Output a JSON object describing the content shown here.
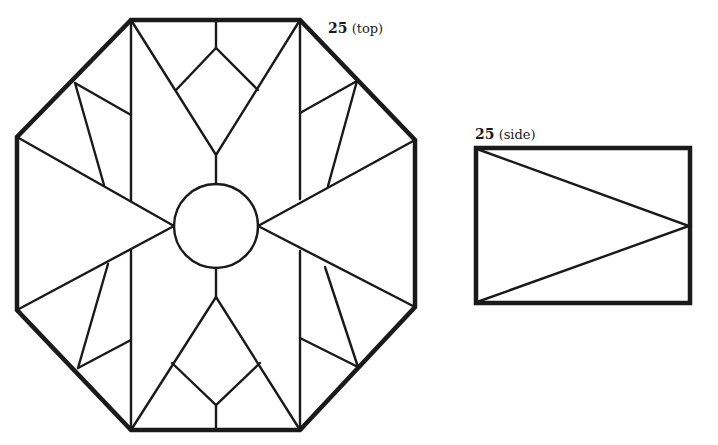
{
  "figure": {
    "top_view": {
      "number": "25",
      "caption": "(top)",
      "shape": "octagon",
      "center_shape": "circle"
    },
    "side_view": {
      "number": "25",
      "caption": "(side)",
      "shape": "rectangle"
    }
  },
  "colors": {
    "line": "#1a1a1a",
    "background": "#ffffff"
  }
}
